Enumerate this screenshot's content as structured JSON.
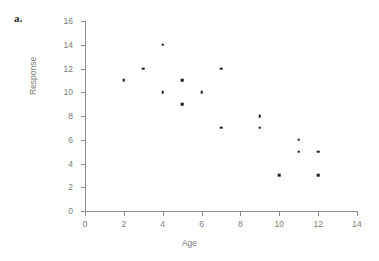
{
  "panel": {
    "label": "a."
  },
  "chart_data": {
    "type": "scatter",
    "title": "",
    "xlabel": "Age",
    "ylabel": "Response",
    "xlim": [
      0,
      14
    ],
    "ylim": [
      0,
      16
    ],
    "xticks": [
      0,
      2,
      4,
      6,
      8,
      10,
      12,
      14
    ],
    "xtick_labels": [
      "0",
      "2",
      "4",
      "6",
      "8",
      "10",
      "12",
      "14"
    ],
    "yticks": [
      0,
      2,
      4,
      6,
      8,
      10,
      12,
      14,
      16
    ],
    "ytick_labels": [
      "0",
      "2",
      "4",
      "6",
      "8",
      "10",
      "12",
      "14",
      "16"
    ],
    "grid": false,
    "legend": false,
    "marker_color": "#1a1a2e",
    "axis_color": "#8e8e8e",
    "label_color": "#7d7d7d",
    "series": [
      {
        "name": "Response vs Age",
        "points": [
          {
            "x": 2,
            "y": 11
          },
          {
            "x": 3,
            "y": 12
          },
          {
            "x": 4,
            "y": 14
          },
          {
            "x": 4,
            "y": 10
          },
          {
            "x": 5,
            "y": 11
          },
          {
            "x": 5,
            "y": 9
          },
          {
            "x": 6,
            "y": 10
          },
          {
            "x": 7,
            "y": 12
          },
          {
            "x": 7,
            "y": 7
          },
          {
            "x": 9,
            "y": 8
          },
          {
            "x": 9,
            "y": 7
          },
          {
            "x": 10,
            "y": 3
          },
          {
            "x": 11,
            "y": 6
          },
          {
            "x": 11,
            "y": 5
          },
          {
            "x": 12,
            "y": 5
          },
          {
            "x": 12,
            "y": 3
          }
        ]
      }
    ]
  }
}
